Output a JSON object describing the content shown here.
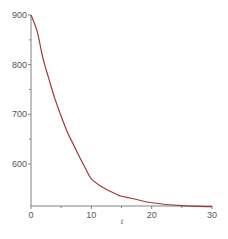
{
  "chart_data": {
    "type": "line",
    "title": "",
    "xlabel": "t",
    "ylabel": "",
    "xlim": [
      0,
      30
    ],
    "ylim": [
      514,
      900
    ],
    "grid": false,
    "legend": null,
    "x_ticks": [
      0,
      10,
      20,
      30
    ],
    "x_tick_labels": [
      "0",
      "10",
      "20",
      "30"
    ],
    "x_minor_ticks": [
      5,
      15,
      25
    ],
    "y_ticks": [
      600,
      700,
      800,
      900
    ],
    "y_tick_labels": [
      "600",
      "700",
      "800",
      "900"
    ],
    "y_minor_ticks": [
      650,
      750,
      850
    ],
    "series": [
      {
        "name": "curve",
        "color": "#a0383a",
        "x": [
          0,
          1,
          2,
          3,
          4,
          5,
          6,
          7,
          8,
          9,
          10,
          12,
          14,
          15,
          17,
          20,
          25,
          30
        ],
        "y": [
          900,
          868,
          812,
          770,
          730,
          696,
          665,
          640,
          615,
          592,
          570,
          552,
          540,
          535,
          530,
          522,
          516,
          514
        ]
      }
    ]
  },
  "colors": {
    "axis": "#808080",
    "curve": "#a0383a"
  }
}
